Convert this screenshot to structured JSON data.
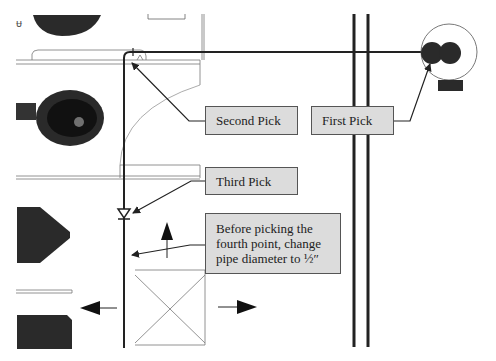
{
  "diagram": {
    "type": "plumbing-layout-instruction",
    "callouts": [
      {
        "id": "second-pick",
        "label": "Second Pick"
      },
      {
        "id": "first-pick",
        "label": "First Pick"
      },
      {
        "id": "third-pick",
        "label": "Third Pick"
      },
      {
        "id": "fourth-note",
        "label": "Before picking the\nfourth point, change\npipe diameter to ½″"
      }
    ],
    "corner_mark": "ⱶ"
  },
  "colors": {
    "background": "#ffffff",
    "callout_fill": "#dcdcdc",
    "callout_border": "#555555",
    "pipe": "#222222",
    "fixture": "#2a2a2a"
  }
}
